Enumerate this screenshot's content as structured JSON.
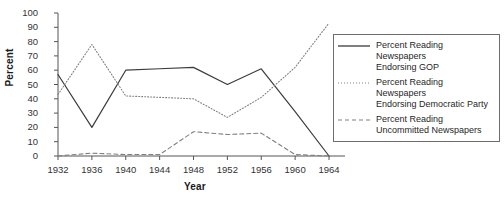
{
  "chart_data": {
    "type": "line",
    "title": "",
    "xlabel": "Year",
    "ylabel": "Percent",
    "categories": [
      "1932",
      "1936",
      "1940",
      "1944",
      "1948",
      "1952",
      "1956",
      "1960",
      "1964"
    ],
    "x": [
      1932,
      1936,
      1940,
      1944,
      1948,
      1952,
      1956,
      1960,
      1964
    ],
    "xlim": [
      1932,
      1964
    ],
    "ylim": [
      0,
      100
    ],
    "ytick_labels": [
      "0",
      "10",
      "20",
      "30",
      "40",
      "50",
      "60",
      "70",
      "80",
      "90",
      "100"
    ],
    "ytick_values": [
      0,
      10,
      20,
      30,
      40,
      50,
      60,
      70,
      80,
      90,
      100
    ],
    "grid": false,
    "legend_position": "right",
    "series": [
      {
        "name": "Percent Reading Newspapers\nEndorsing GOP",
        "style": "solid",
        "color": "#3c3c3c",
        "values": [
          57,
          20,
          60,
          61,
          62,
          50,
          61,
          31,
          0
        ]
      },
      {
        "name": "Percent Reading Newspapers\nEndorsing Democratic Party",
        "style": "dotted",
        "color": "#808080",
        "values": [
          43,
          78,
          42,
          41,
          40,
          27,
          41,
          62,
          93
        ]
      },
      {
        "name": "Percent Reading\nUncommitted Newspapers",
        "style": "dashed",
        "color": "#808080",
        "values": [
          0,
          2,
          1,
          1,
          17,
          15,
          16,
          1,
          0
        ]
      }
    ]
  },
  "legend": {
    "entries": [
      {
        "label": "Percent Reading Newspapers\nEndorsing GOP",
        "style": "solid"
      },
      {
        "label": "Percent Reading Newspapers\nEndorsing Democratic Party",
        "style": "dotted"
      },
      {
        "label": "Percent Reading\nUncommitted Newspapers",
        "style": "dashed"
      }
    ]
  }
}
